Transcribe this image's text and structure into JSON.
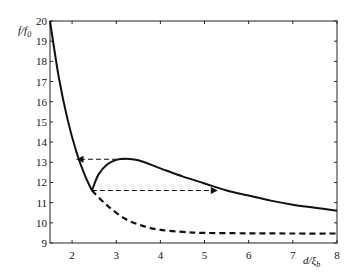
{
  "chart_data": {
    "type": "line",
    "title": "",
    "xlabel": "d/ξ_b",
    "ylabel": "f/f_0",
    "xlim": [
      1.5,
      8
    ],
    "ylim": [
      9,
      20
    ],
    "xticks": [
      2,
      3,
      4,
      5,
      6,
      7,
      8
    ],
    "yticks": [
      9,
      10,
      11,
      12,
      13,
      14,
      15,
      16,
      17,
      18,
      19,
      20
    ],
    "grid": false,
    "legend": null,
    "series": [
      {
        "name": "solid-branch-left",
        "style": "solid",
        "x": [
          1.5,
          1.7,
          1.9,
          2.1,
          2.3,
          2.45
        ],
        "y": [
          20.0,
          17.2,
          15.1,
          13.5,
          12.3,
          11.6
        ]
      },
      {
        "name": "solid-branch-right",
        "style": "solid",
        "x": [
          2.45,
          2.6,
          2.8,
          3.0,
          3.2,
          3.5,
          4.0,
          4.5,
          5.0,
          5.5,
          6.0,
          6.5,
          7.0,
          7.5,
          8.0
        ],
        "y": [
          11.6,
          12.4,
          12.9,
          13.12,
          13.18,
          13.1,
          12.7,
          12.3,
          11.95,
          11.6,
          11.35,
          11.1,
          10.9,
          10.75,
          10.6
        ]
      },
      {
        "name": "dashed-lower-branch",
        "style": "dashed",
        "x": [
          2.45,
          2.8,
          3.2,
          3.6,
          4.0,
          4.5,
          5.0,
          6.0,
          7.0,
          8.0
        ],
        "y": [
          11.6,
          10.85,
          10.2,
          9.85,
          9.65,
          9.55,
          9.5,
          9.48,
          9.47,
          9.47
        ]
      }
    ],
    "annotations": [
      {
        "type": "dashed-arrow",
        "from": [
          3.2,
          13.15
        ],
        "to": [
          2.1,
          13.15
        ],
        "direction": "left"
      },
      {
        "type": "dashed-arrow",
        "from": [
          2.45,
          11.6
        ],
        "to": [
          5.3,
          11.6
        ],
        "direction": "right"
      }
    ]
  },
  "axes": {
    "xlabel_main": "d/ξ",
    "xlabel_sub": "b",
    "ylabel_main": "f/f",
    "ylabel_sub": "0",
    "xtick_labels": [
      "2",
      "3",
      "4",
      "5",
      "6",
      "7",
      "8"
    ],
    "ytick_labels": [
      "9",
      "10",
      "11",
      "12",
      "13",
      "14",
      "15",
      "16",
      "17",
      "18",
      "19",
      "20"
    ]
  },
  "colors": {
    "line": "#111111",
    "axis": "#222222",
    "background": "#ffffff"
  }
}
